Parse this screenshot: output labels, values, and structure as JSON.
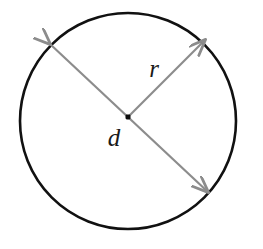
{
  "figure": {
    "name": "circle-radius-diameter-diagram",
    "background_color": "#ffffff",
    "width": 263,
    "height": 249
  },
  "circle": {
    "stroke_color": "#111111",
    "stroke_width": 2.6,
    "fill": "none",
    "center_x": 128,
    "center_y": 121,
    "radius": 108
  },
  "center_point": {
    "label": "center-dot",
    "color": "#0d0d0d",
    "x": 128,
    "y": 117,
    "size": 5
  },
  "arrows": {
    "color": "#8c8c8c",
    "stroke_width": 2.2,
    "diameter": {
      "label": "d",
      "description": "double-headed arrow across the circle",
      "start_x": 50,
      "start_y": 44,
      "end_x": 208,
      "end_y": 192
    },
    "radius": {
      "label": "r",
      "description": "single-headed arrow from center to circle edge",
      "start_x": 128,
      "start_y": 117,
      "end_x": 205,
      "end_y": 40
    }
  },
  "labels": {
    "diameter_label": {
      "text": "d",
      "x": 114,
      "y": 146,
      "font_size": 25
    },
    "radius_label": {
      "text": "r",
      "x": 154,
      "y": 77,
      "font_size": 25
    }
  }
}
